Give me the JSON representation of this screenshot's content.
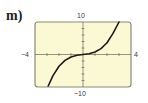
{
  "figure": {
    "part_label": "m)"
  },
  "chart_data": {
    "type": "line",
    "title": "",
    "xlabel": "",
    "ylabel": "",
    "xlim": [
      -4,
      4
    ],
    "ylim": [
      -10,
      10
    ],
    "x_tick_labels": {
      "min": "−4",
      "max": "4"
    },
    "y_tick_labels": {
      "min": "−10",
      "max": "10"
    },
    "x_tick_step": 1,
    "y_tick_step": 2,
    "grid": false,
    "background_color": "#fbf9d4",
    "frame_color": "#8a8a7a",
    "curve_color": "#1a1a1a",
    "series": [
      {
        "name": "f(x)",
        "description": "increasing cubic-shaped curve with inflection at the origin",
        "x": [
          -2.9,
          -2.5,
          -2.0,
          -1.5,
          -1.0,
          -0.5,
          0.0,
          0.5,
          1.0,
          1.5,
          2.0,
          2.5,
          3.0
        ],
        "y": [
          -9.7,
          -6.5,
          -3.6,
          -1.8,
          -0.75,
          -0.24,
          0.0,
          0.24,
          0.75,
          1.8,
          3.6,
          6.5,
          10.0
        ]
      }
    ]
  }
}
